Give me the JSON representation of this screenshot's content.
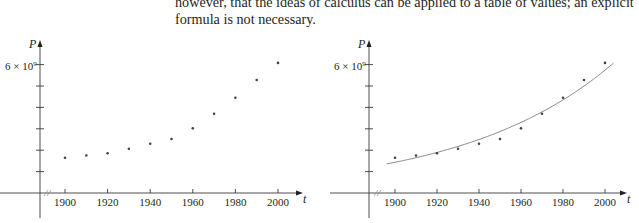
{
  "text": {
    "line1": "however, that the ideas of calculus can be applied to a table of values; an explicit",
    "line2": "formula is not necessary."
  },
  "charts": [
    {
      "id": "left",
      "y_label": "P",
      "x_label": "t",
      "y_tick_label": "6 × 10",
      "y_tick_exp": "9",
      "x_tick_labels": [
        "1900",
        "1920",
        "1940",
        "1960",
        "1980",
        "2000"
      ],
      "show_curve": false
    },
    {
      "id": "right",
      "y_label": "P",
      "x_label": "t",
      "y_tick_label": "6 × 10",
      "y_tick_exp": "9",
      "x_tick_labels": [
        "1900",
        "1920",
        "1940",
        "1960",
        "1980",
        "2000"
      ],
      "show_curve": true
    }
  ],
  "colors": {
    "axis": "#3a3a3a",
    "points": "#444444",
    "curve": "#8a8a8a"
  },
  "chart_data": [
    {
      "type": "scatter",
      "title": "",
      "xlabel": "t",
      "ylabel": "P",
      "x": [
        1900,
        1910,
        1920,
        1930,
        1940,
        1950,
        1960,
        1970,
        1980,
        1990,
        2000
      ],
      "values": [
        1650000000.0,
        1750000000.0,
        1860000000.0,
        2070000000.0,
        2300000000.0,
        2520000000.0,
        3020000000.0,
        3700000000.0,
        4450000000.0,
        5280000000.0,
        6080000000.0
      ],
      "x_ticks": [
        1900,
        1920,
        1940,
        1960,
        1980,
        2000
      ],
      "y_ticks": [
        1000000000.0,
        2000000000.0,
        3000000000.0,
        4000000000.0,
        5000000000.0,
        6000000000.0
      ],
      "y_tick_labels_shown": [
        "6 × 10^9"
      ],
      "xlim": [
        1880,
        2010
      ],
      "ylim": [
        0,
        7000000000.0
      ],
      "axis_break": "x-axis break between origin and 1900",
      "grid": false,
      "legend": null
    },
    {
      "type": "scatter",
      "title": "",
      "xlabel": "t",
      "ylabel": "P",
      "x": [
        1900,
        1910,
        1920,
        1930,
        1940,
        1950,
        1960,
        1970,
        1980,
        1990,
        2000
      ],
      "values": [
        1650000000.0,
        1750000000.0,
        1860000000.0,
        2070000000.0,
        2300000000.0,
        2520000000.0,
        3020000000.0,
        3700000000.0,
        4450000000.0,
        5280000000.0,
        6080000000.0
      ],
      "series": [
        {
          "name": "data",
          "type": "scatter",
          "x": [
            1900,
            1910,
            1920,
            1930,
            1940,
            1950,
            1960,
            1970,
            1980,
            1990,
            2000
          ],
          "values": [
            1650000000.0,
            1750000000.0,
            1860000000.0,
            2070000000.0,
            2300000000.0,
            2520000000.0,
            3020000000.0,
            3700000000.0,
            4450000000.0,
            5280000000.0,
            6080000000.0
          ]
        },
        {
          "name": "exponential model",
          "type": "line",
          "formula": "P = 1.4364e9 * 1.01395^(t-1900)",
          "x_range": [
            1896,
            2004
          ]
        }
      ],
      "x_ticks": [
        1900,
        1920,
        1940,
        1960,
        1980,
        2000
      ],
      "y_ticks": [
        1000000000.0,
        2000000000.0,
        3000000000.0,
        4000000000.0,
        5000000000.0,
        6000000000.0
      ],
      "y_tick_labels_shown": [
        "6 × 10^9"
      ],
      "xlim": [
        1880,
        2010
      ],
      "ylim": [
        0,
        7000000000.0
      ],
      "grid": false,
      "legend": null
    }
  ]
}
